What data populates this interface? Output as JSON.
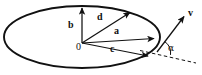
{
  "figure": {
    "background_color": "#ffffff",
    "stroke_color": "#111111",
    "width": 202,
    "height": 75
  },
  "labels": {
    "origin": "0",
    "vector_a": "a",
    "vector_b": "b",
    "vector_c": "c",
    "vector_d": "d",
    "vector_v": "v",
    "angle_alpha": "α"
  },
  "geometry": {
    "ellipse": {
      "center_x": 82,
      "center_y": 37,
      "radius_x": 78,
      "radius_y": 31,
      "stroke_width": 1.9
    },
    "origin_point": {
      "x": 82,
      "y": 43
    },
    "vectors": [
      {
        "name": "a",
        "from_x": 82,
        "from_y": 43,
        "to_x": 156,
        "to_y": 38,
        "label_x": 118,
        "label_y": 30
      },
      {
        "name": "b",
        "from_x": 82,
        "from_y": 43,
        "to_x": 82,
        "to_y": 6,
        "label_x": 71,
        "label_y": 24
      },
      {
        "name": "c",
        "from_x": 82,
        "from_y": 43,
        "to_x": 150,
        "to_y": 57,
        "label_x": 114,
        "label_y": 48
      },
      {
        "name": "d",
        "from_x": 82,
        "from_y": 43,
        "to_x": 132,
        "to_y": 11,
        "label_x": 101,
        "label_y": 17
      },
      {
        "name": "v",
        "from_x": 157,
        "from_y": 52,
        "to_x": 186,
        "to_y": 14,
        "label_x": 189,
        "label_y": 10
      }
    ],
    "dashed_tangent": {
      "from_x": 140,
      "from_y": 52,
      "to_x": 196,
      "to_y": 63
    },
    "angle_arc": {
      "center_x": 157,
      "center_y": 52,
      "radius": 13
    },
    "alpha_label": {
      "x": 168,
      "y": 45
    }
  }
}
